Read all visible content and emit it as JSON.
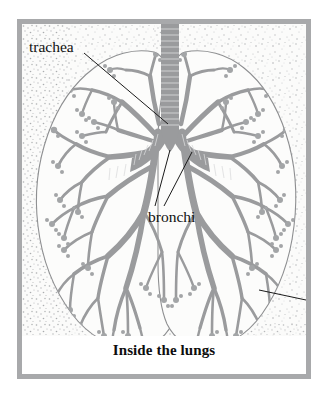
{
  "figure": {
    "caption": "Inside the lungs",
    "frame_color": "#a8a9ab",
    "background_color": "#ffffff",
    "plate_background_color": "#fbfbfa",
    "airway_color": "#9a9b9d",
    "outline_color": "#8e8f91",
    "leader_line_color": "#1a1a1a",
    "stipple_color": "#b9bbbd",
    "width": 294,
    "height": 360
  },
  "labels": [
    {
      "id": "trachea",
      "text": "trachea"
    },
    {
      "id": "bronchi",
      "text": "bronchi"
    }
  ],
  "icon_names": {
    "trachea_leader": "leader-line-icon",
    "bronchi_leader_left": "leader-line-icon",
    "bronchi_leader_right": "leader-line-icon",
    "edge_leader": "leader-line-icon"
  },
  "structures": [
    {
      "name": "trachea",
      "description": "vertical ringed airway at top center"
    },
    {
      "name": "left-main-bronchus",
      "description": "ringed airway branching to viewer left"
    },
    {
      "name": "right-main-bronchus",
      "description": "ringed airway branching to viewer right"
    },
    {
      "name": "left-lung",
      "description": "outlined lobe with bronchial tree"
    },
    {
      "name": "right-lung",
      "description": "outlined lobe with bronchial tree"
    }
  ]
}
